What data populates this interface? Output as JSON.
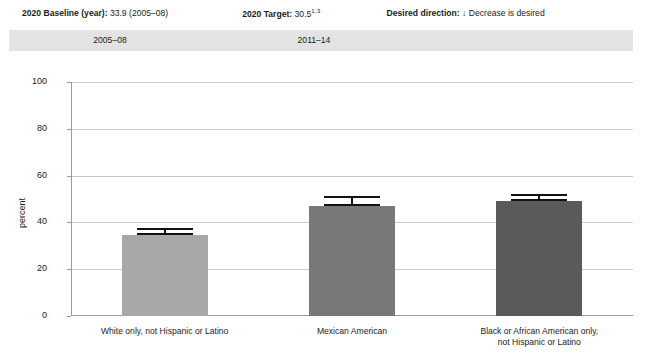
{
  "header": {
    "baseline_label": "2020 Baseline (year):",
    "baseline_value": "33.9 (2005–08)",
    "target_label": "2020 Target:",
    "target_value": "30.5",
    "target_footnote": "1,3",
    "direction_label": "Desired direction:",
    "direction_arrow": "↓",
    "direction_value": "Decrease is desired"
  },
  "year_band": {
    "periods": [
      "2005–08",
      "2011–14"
    ],
    "background_color": "#e3e3e3"
  },
  "chart_data": {
    "type": "bar",
    "title": "",
    "xlabel": "",
    "ylabel": "percent",
    "ylim": [
      0,
      100
    ],
    "ytick_values": [
      0,
      20,
      40,
      60,
      80,
      100
    ],
    "ytick_labels": [
      "0",
      "20",
      "40",
      "60",
      "80",
      "100"
    ],
    "grid": true,
    "legend": "none",
    "categories": [
      "White only, not Hispanic or Latino",
      "Mexican American",
      "Black or African American only,\nnot Hispanic or Latino"
    ],
    "values": [
      34.8,
      47.0,
      49.3
    ],
    "error_low": [
      32.6,
      43.6,
      46.3
    ],
    "error_high": [
      37.7,
      51.3,
      52.2
    ],
    "bar_colors": [
      "#a8a8a8",
      "#787878",
      "#5a5a5a"
    ],
    "error_bar_color": "#111111"
  },
  "axis_colors": {
    "gridline": "#c9c9c9",
    "axis": "#9a9a9a"
  }
}
